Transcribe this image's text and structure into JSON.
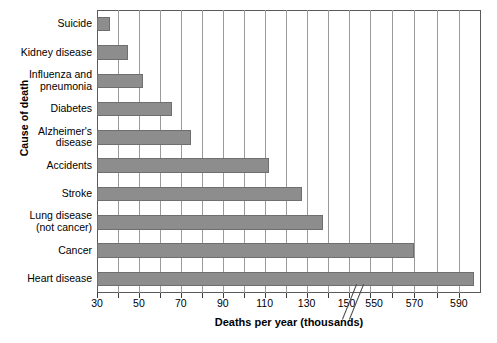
{
  "chart_data": {
    "type": "bar",
    "orientation": "horizontal",
    "title": "",
    "xlabel": "Deaths per year (thousands)",
    "ylabel": "Cause of death",
    "categories": [
      "Suicide",
      "Kidney disease",
      "Influenza and\npneumonia",
      "Diabetes",
      "Alzheimer's\ndisease",
      "Accidents",
      "Stroke",
      "Lung disease\n(not cancer)",
      "Cancer",
      "Heart disease"
    ],
    "values": [
      36,
      45,
      52,
      66,
      75,
      112,
      128,
      138,
      570,
      597
    ],
    "xtick_labels": [
      "30",
      "50",
      "70",
      "90",
      "110",
      "130",
      "150",
      "550",
      "570",
      "590"
    ],
    "xtick_values": [
      30,
      50,
      70,
      90,
      110,
      130,
      150,
      550,
      570,
      590
    ],
    "axis_break": {
      "present": true,
      "between": [
        150,
        550
      ],
      "style": "double-diagonal-slash"
    },
    "xlim_segment_1": [
      30,
      155
    ],
    "xlim_segment_2": [
      545,
      600
    ],
    "minor_tick_interval": 10,
    "grid": "vertical-only",
    "legend": "none",
    "bar_color": "#8d8d8d",
    "bar_edge_color": "#6f6f6f",
    "grid_color": "#9a9a9a",
    "axis_color": "#5a5a5a"
  }
}
